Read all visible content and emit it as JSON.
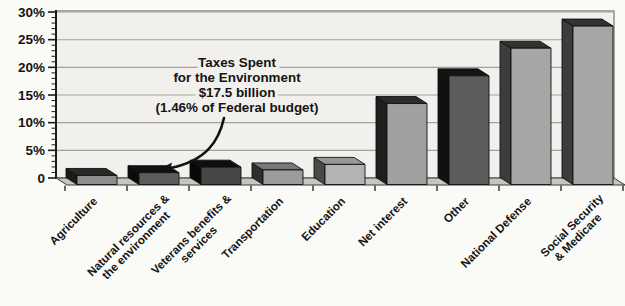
{
  "chart_data": {
    "type": "bar",
    "projection": "3d-oblique",
    "title": "",
    "xlabel": "",
    "ylabel": "",
    "ylim": [
      0,
      30
    ],
    "ytick_step": 5,
    "minor_tick_step": 1,
    "ytick_labels": [
      "30%",
      "25%",
      "20%",
      "15%",
      "10%",
      "5%",
      "0"
    ],
    "ytick_values": [
      30,
      25,
      20,
      15,
      10,
      5,
      0
    ],
    "grid": true,
    "legend": false,
    "unit": "%",
    "categories": [
      "Agriculture",
      "Natural resources & the environment",
      "Veterans benefits & services",
      "Transportation",
      "Education",
      "Net interest",
      "Other",
      "National Defense",
      "Social Security & Medicare"
    ],
    "category_label_lines": [
      [
        "Agriculture"
      ],
      [
        "Natural resources &",
        "the environment"
      ],
      [
        "Veterans benefits &",
        "services"
      ],
      [
        "Transportation"
      ],
      [
        "Education"
      ],
      [
        "Net interest"
      ],
      [
        "Other"
      ],
      [
        "National Defense"
      ],
      [
        "Social Security",
        "& Medicare"
      ]
    ],
    "values": [
      1,
      1.5,
      2.5,
      2,
      3,
      14,
      19,
      24,
      28
    ],
    "bar_colors": [
      {
        "front": "#8e8e8e",
        "top": "#2a2a2a",
        "side": "#1b1b1b"
      },
      {
        "front": "#5c5c5c",
        "top": "#111111",
        "side": "#0c0c0c"
      },
      {
        "front": "#474747",
        "top": "#0e0e0e",
        "side": "#080808"
      },
      {
        "front": "#9b9b9b",
        "top": "#787878",
        "side": "#2e2e2e"
      },
      {
        "front": "#b3b3b3",
        "top": "#989898",
        "side": "#4a4a4a"
      },
      {
        "front": "#a0a0a0",
        "top": "#2c2c2c",
        "side": "#1e1e1e"
      },
      {
        "front": "#5d5d5d",
        "top": "#141414",
        "side": "#111111"
      },
      {
        "front": "#a6a6a6",
        "top": "#323232",
        "side": "#3c3c3c"
      },
      {
        "front": "#a6a6a6",
        "top": "#323232",
        "side": "#3c3c3c"
      }
    ],
    "annotation": {
      "lines": [
        "Taxes Spent",
        "for the Environment",
        "$17.5 billion",
        "(1.46% of Federal budget)"
      ],
      "points_to": "Natural resources & the environment"
    },
    "colors": {
      "page_bg": "#fafaf7",
      "wall_bg": "#f1f0ec",
      "wall_border": "#97958f",
      "gridline": "#a3a19b",
      "axis": "#1c1c1c",
      "floor": "#c7c5c0",
      "floor_edge": "#3a3a3a",
      "text": "#141414",
      "bar_outline": "#101010"
    }
  }
}
